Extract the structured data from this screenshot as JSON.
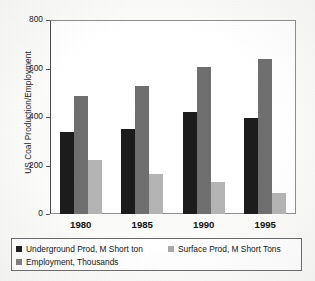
{
  "chart_data": {
    "type": "bar",
    "title": "",
    "xlabel": "",
    "ylabel": "US Coal Production/Employment",
    "categories": [
      "1980",
      "1985",
      "1990",
      "1995"
    ],
    "series": [
      {
        "name": "Underground Prod, M Short ton",
        "color": "#1c1c1c",
        "values": [
          338,
          350,
          420,
          395
        ]
      },
      {
        "name": "Surface Prod, M Short Tons",
        "color": "#6f6f6f",
        "values": [
          487,
          528,
          606,
          638
        ]
      },
      {
        "name": "Employment, Thousands",
        "color": "#b4b4b4",
        "values": [
          223,
          165,
          132,
          88
        ]
      }
    ],
    "ylim": [
      0,
      800
    ],
    "yticks": [
      0,
      200,
      400,
      600,
      800
    ],
    "ytick_labels": [
      "0",
      "200",
      "400",
      "600",
      "800"
    ],
    "grid": false,
    "legend_position": "bottom"
  },
  "legend": {
    "items": [
      {
        "label": "Underground Prod, M Short ton",
        "swatch": "legend-swatch-underground"
      },
      {
        "label": "Surface Prod, M Short Tons",
        "swatch": "legend-swatch-surface"
      },
      {
        "label": "Employment, Thousands",
        "swatch": "legend-swatch-employment"
      }
    ]
  }
}
